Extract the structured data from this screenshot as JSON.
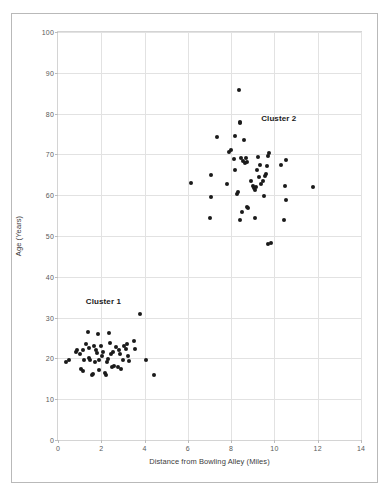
{
  "chart_data": {
    "type": "scatter",
    "title": "",
    "xlabel": "Distance from Bowling Alley (Miles)",
    "ylabel": "Age (Years)",
    "xlim": [
      0,
      14
    ],
    "ylim": [
      0,
      100
    ],
    "xticks": [
      0,
      2,
      4,
      6,
      8,
      10,
      12,
      14
    ],
    "yticks": [
      0,
      10,
      20,
      30,
      40,
      50,
      60,
      70,
      80,
      90,
      100
    ],
    "grid": true,
    "legend": "none",
    "marker": "filled-circle",
    "marker_color": "#1a1a1a",
    "annotations": [
      {
        "text": "Cluster 1",
        "x": 2.1,
        "y": 34.0
      },
      {
        "text": "Cluster 2",
        "x": 10.2,
        "y": 79.0
      }
    ],
    "series": [
      {
        "name": "Cluster 1",
        "points": [
          [
            0.35,
            19.0
          ],
          [
            0.5,
            19.5
          ],
          [
            0.85,
            21.5
          ],
          [
            0.9,
            22.0
          ],
          [
            1.0,
            21.0
          ],
          [
            1.05,
            17.5
          ],
          [
            1.15,
            17.0
          ],
          [
            1.15,
            22.0
          ],
          [
            1.2,
            19.5
          ],
          [
            1.3,
            23.5
          ],
          [
            1.4,
            26.5
          ],
          [
            1.45,
            22.5
          ],
          [
            1.45,
            20.0
          ],
          [
            1.5,
            19.5
          ],
          [
            1.55,
            16.0
          ],
          [
            1.6,
            16.2
          ],
          [
            1.65,
            23.0
          ],
          [
            1.7,
            19.0
          ],
          [
            1.75,
            22.0
          ],
          [
            1.8,
            21.3
          ],
          [
            1.85,
            26.0
          ],
          [
            1.9,
            19.5
          ],
          [
            1.9,
            17.2
          ],
          [
            2.0,
            23.0
          ],
          [
            2.05,
            20.5
          ],
          [
            2.1,
            21.5
          ],
          [
            2.15,
            16.3
          ],
          [
            2.2,
            16.0
          ],
          [
            2.25,
            19.0
          ],
          [
            2.3,
            19.8
          ],
          [
            2.35,
            26.3
          ],
          [
            2.4,
            23.8
          ],
          [
            2.45,
            21.0
          ],
          [
            2.5,
            17.8
          ],
          [
            2.55,
            21.5
          ],
          [
            2.6,
            18.2
          ],
          [
            2.7,
            22.8
          ],
          [
            2.75,
            18.0
          ],
          [
            2.8,
            22.0
          ],
          [
            2.85,
            21.0
          ],
          [
            2.9,
            17.5
          ],
          [
            3.0,
            19.5
          ],
          [
            3.05,
            23.0
          ],
          [
            3.15,
            22.2
          ],
          [
            3.2,
            23.5
          ],
          [
            3.25,
            20.5
          ],
          [
            3.3,
            19.3
          ],
          [
            3.5,
            24.3
          ],
          [
            3.55,
            22.3
          ],
          [
            3.8,
            31.0
          ],
          [
            4.05,
            19.5
          ],
          [
            4.45,
            16.0
          ]
        ]
      },
      {
        "name": "Cluster 2",
        "points": [
          [
            6.15,
            63.0
          ],
          [
            7.05,
            65.0
          ],
          [
            7.05,
            59.6
          ],
          [
            7.0,
            54.5
          ],
          [
            7.35,
            74.3
          ],
          [
            7.8,
            62.7
          ],
          [
            7.9,
            70.5
          ],
          [
            8.0,
            71.2
          ],
          [
            8.15,
            68.8
          ],
          [
            8.2,
            74.5
          ],
          [
            8.2,
            66.1
          ],
          [
            8.25,
            60.3
          ],
          [
            8.3,
            60.8
          ],
          [
            8.35,
            85.7
          ],
          [
            8.4,
            77.7
          ],
          [
            8.42,
            78.0
          ],
          [
            8.45,
            69.0
          ],
          [
            8.5,
            55.8
          ],
          [
            8.4,
            54.0
          ],
          [
            8.55,
            68.5
          ],
          [
            8.6,
            73.5
          ],
          [
            8.65,
            67.8
          ],
          [
            8.7,
            69.0
          ],
          [
            8.72,
            68.2
          ],
          [
            8.75,
            57.0
          ],
          [
            8.8,
            56.8
          ],
          [
            8.9,
            63.5
          ],
          [
            9.0,
            62.2
          ],
          [
            9.05,
            61.8
          ],
          [
            9.1,
            61.2
          ],
          [
            9.15,
            62.0
          ],
          [
            9.2,
            66.2
          ],
          [
            9.25,
            69.3
          ],
          [
            9.3,
            64.5
          ],
          [
            9.35,
            67.5
          ],
          [
            9.4,
            62.8
          ],
          [
            9.45,
            63.6
          ],
          [
            9.5,
            59.7
          ],
          [
            9.55,
            64.8
          ],
          [
            9.6,
            65.2
          ],
          [
            9.65,
            67.2
          ],
          [
            9.7,
            69.6
          ],
          [
            9.75,
            70.3
          ],
          [
            9.7,
            48.0
          ],
          [
            9.85,
            48.3
          ],
          [
            9.1,
            54.5
          ],
          [
            10.3,
            67.5
          ],
          [
            10.55,
            68.6
          ],
          [
            10.5,
            62.2
          ],
          [
            10.55,
            58.8
          ],
          [
            10.45,
            54.0
          ],
          [
            11.8,
            62.0
          ]
        ]
      }
    ]
  }
}
